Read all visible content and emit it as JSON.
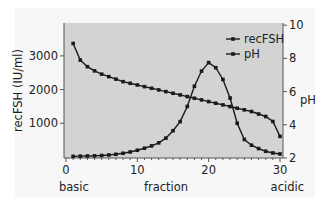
{
  "chart_data": {
    "type": "line",
    "title": "",
    "xlabel": "fraction",
    "xlabel_left": "basic",
    "xlabel_right": "acidic",
    "ylabel": "recFSH (IU/ml)",
    "y2label": "pH",
    "xlim": [
      0,
      30
    ],
    "ylim": [
      0,
      4000
    ],
    "y2lim": [
      2,
      10
    ],
    "xticks": [
      0,
      10,
      20,
      30
    ],
    "yticks": [
      1000,
      2000,
      3000
    ],
    "y2ticks": [
      2,
      4,
      6,
      8,
      10
    ],
    "grid": false,
    "legend_position": "upper right",
    "x": [
      1,
      2,
      3,
      4,
      5,
      6,
      7,
      8,
      9,
      10,
      11,
      12,
      13,
      14,
      15,
      16,
      17,
      18,
      19,
      20,
      21,
      22,
      23,
      24,
      25,
      26,
      27,
      28,
      29,
      30
    ],
    "series": [
      {
        "name": "recFSH",
        "axis": "left",
        "values": [
          20,
          25,
          30,
          35,
          45,
          60,
          80,
          110,
          150,
          200,
          260,
          330,
          420,
          560,
          780,
          1050,
          1500,
          2100,
          2550,
          2800,
          2650,
          2300,
          1750,
          1000,
          520,
          350,
          250,
          170,
          120,
          90
        ]
      },
      {
        "name": "pH",
        "axis": "right",
        "values": [
          8.9,
          7.9,
          7.5,
          7.25,
          7.05,
          6.9,
          6.75,
          6.6,
          6.5,
          6.4,
          6.3,
          6.2,
          6.1,
          6.0,
          5.9,
          5.8,
          5.7,
          5.6,
          5.5,
          5.4,
          5.3,
          5.2,
          5.1,
          5.0,
          4.9,
          4.8,
          4.65,
          4.5,
          4.2,
          3.3
        ]
      }
    ]
  },
  "colors": {
    "plot_bg": "#d3d3d3",
    "line": "#1a1a1a",
    "axis": "#555555"
  }
}
